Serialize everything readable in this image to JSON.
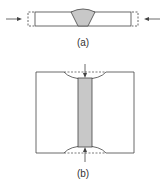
{
  "figure": {
    "panels": [
      {
        "id": "a",
        "label": "(a)",
        "description": "Side view of butt-welded plate with V-groove weld; dashed outlines at ends and inward arrows indicate transverse shrinkage"
      },
      {
        "id": "b",
        "label": "(b)",
        "description": "Plan view of welded plates with shaded weld strip; curved edges, dashed original lines and inward arrows indicate longitudinal shrinkage"
      }
    ]
  },
  "colors": {
    "stroke": "#444444",
    "weld_fill": "#c8c8c8",
    "background": "#ffffff"
  }
}
